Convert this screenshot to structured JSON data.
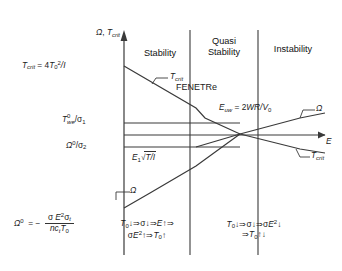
{
  "figure": {
    "axes": {
      "y_axis_label": "Ω, T",
      "y_axis_label_sub": "crit",
      "x_axis_label": "E"
    },
    "zones": [
      {
        "id": "stability",
        "label": "Stability"
      },
      {
        "id": "quasi-stability",
        "label": "Quasi\nStability",
        "line1": "Quasi",
        "line2": "Stability"
      },
      {
        "id": "instability",
        "label": "Instability"
      }
    ],
    "center_label": "FENETRe",
    "y_tick_labels": [
      {
        "id": "t-crit-value",
        "text": "T_crit = 4T_0^2/I"
      },
      {
        "id": "t-we-sigma1",
        "text": "T_we^0/σ_1"
      },
      {
        "id": "omega0-sigma2",
        "text": "Ω^0/σ_2"
      }
    ],
    "curve_labels": [
      {
        "id": "t-crit-upper",
        "text": "T",
        "sub": "crit"
      },
      {
        "id": "omega-lower-left",
        "text": "Ω"
      },
      {
        "id": "omega-right",
        "text": "Ω"
      },
      {
        "id": "t-crit-right",
        "text": "T",
        "sub": "crit"
      }
    ],
    "formulas": {
      "omega_zero": {
        "lhs": "Ω",
        "lhs_sup": "0",
        "eq": "= −",
        "numerator": "σ E",
        "numerator_sup": "2",
        "numerator_tail": "σ",
        "numerator_tail_sub": "t",
        "denominator": "nc",
        "denominator_sub": "t",
        "denominator_tail": "T",
        "denominator_tail_sub": "0"
      },
      "e1_sqrt": {
        "prefix": "E",
        "prefix_sub": "1",
        "radical": "√",
        "under": "T/I"
      },
      "e_uw": {
        "lhs": "E",
        "lhs_sub": "uw",
        "rhs": "= 2WR/V",
        "rhs_sub": "0"
      }
    },
    "mechanism_notes": [
      {
        "id": "stability-mechanism",
        "line1": "T_0↓ ⇒ σ↓ ⇒ E↑ ⇒",
        "line2": "σE^2↑ ⇒ T_0↑"
      },
      {
        "id": "instability-mechanism",
        "line1": "T_0↓ ⇒ σ↓ ⇒ σE^2↓",
        "line2": "⇒ T_0↑↓"
      }
    ],
    "colors": {
      "line": "#3a3a3a",
      "text": "#1a1a1a",
      "background": "#ffffff"
    }
  }
}
